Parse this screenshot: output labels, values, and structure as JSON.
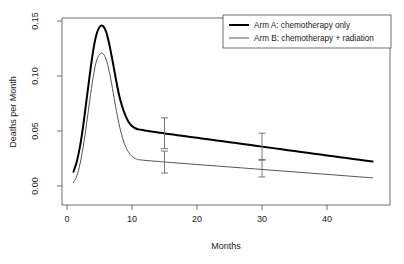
{
  "chart_data": {
    "type": "line",
    "title": "",
    "xlabel": "Months",
    "ylabel": "Deaths per Month",
    "xlim": [
      0,
      47
    ],
    "ylim": [
      0.0,
      0.155
    ],
    "grid": false,
    "legend_position": "top-right",
    "x_ticks": [
      "0",
      "10",
      "20",
      "30",
      "40"
    ],
    "x_tick_values": [
      0,
      10,
      20,
      30,
      40
    ],
    "y_ticks": [
      "0.00",
      "0.05",
      "0.10",
      "0.15"
    ],
    "y_tick_values": [
      0.0,
      0.05,
      0.1,
      0.15
    ],
    "series": [
      {
        "name": "Arm A: chemotherapy only",
        "color": "#000000",
        "line_width": 2.0,
        "x": [
          1,
          1.5,
          2,
          2.5,
          3,
          3.5,
          4,
          4.5,
          5,
          5.5,
          6,
          6.5,
          7,
          7.5,
          8,
          8.5,
          9,
          9.5,
          10,
          10.5,
          11,
          12,
          13,
          14,
          15,
          17,
          19,
          21,
          23,
          25,
          27,
          29,
          31,
          33,
          35,
          37,
          39,
          41,
          43,
          45,
          47
        ],
        "values": [
          0.013,
          0.022,
          0.036,
          0.055,
          0.078,
          0.101,
          0.122,
          0.137,
          0.1445,
          0.1455,
          0.1405,
          0.129,
          0.114,
          0.098,
          0.083,
          0.072,
          0.064,
          0.058,
          0.0545,
          0.0525,
          0.0515,
          0.0505,
          0.0495,
          0.0487,
          0.0478,
          0.0462,
          0.0446,
          0.043,
          0.0414,
          0.0398,
          0.0382,
          0.0366,
          0.035,
          0.0334,
          0.0318,
          0.0302,
          0.0286,
          0.027,
          0.0254,
          0.0238,
          0.0222
        ]
      },
      {
        "name": "Arm B: chemotherapy + radiation",
        "color": "#555555",
        "line_width": 1.0,
        "x": [
          1,
          1.5,
          2,
          2.5,
          3,
          3.5,
          4,
          4.5,
          5,
          5.5,
          6,
          6.5,
          7,
          7.5,
          8,
          8.5,
          9,
          9.5,
          10,
          10.5,
          11,
          12,
          13,
          14,
          15,
          17,
          19,
          21,
          23,
          25,
          27,
          29,
          31,
          33,
          35,
          37,
          39,
          41,
          43,
          45,
          47
        ],
        "values": [
          0.003,
          0.009,
          0.02,
          0.036,
          0.056,
          0.078,
          0.098,
          0.113,
          0.1195,
          0.1205,
          0.1155,
          0.104,
          0.0885,
          0.0715,
          0.0565,
          0.0445,
          0.036,
          0.0305,
          0.027,
          0.025,
          0.024,
          0.0233,
          0.0228,
          0.0223,
          0.0218,
          0.0209,
          0.02,
          0.0191,
          0.0182,
          0.0173,
          0.0164,
          0.0155,
          0.0146,
          0.0137,
          0.0128,
          0.0119,
          0.011,
          0.0101,
          0.0092,
          0.0083,
          0.0074
        ]
      }
    ],
    "error_bars": [
      {
        "series": "Arm A: chemotherapy only",
        "x": 15,
        "y": 0.0478,
        "low": 0.034,
        "high": 0.062
      },
      {
        "series": "Arm A: chemotherapy only",
        "x": 30,
        "y": 0.0358,
        "low": 0.0235,
        "high": 0.048
      },
      {
        "series": "Arm B: chemotherapy + radiation",
        "x": 15,
        "y": 0.0218,
        "low": 0.0118,
        "high": 0.0318
      },
      {
        "series": "Arm B: chemotherapy + radiation",
        "x": 30,
        "y": 0.016,
        "low": 0.0082,
        "high": 0.024
      }
    ]
  },
  "legend": {
    "entries": [
      {
        "label": "Arm A: chemotherapy only"
      },
      {
        "label": "Arm B: chemotherapy + radiation"
      }
    ]
  },
  "axes": {
    "x_title": "Months",
    "y_title": "Deaths per Month"
  },
  "colors": {
    "arm_a": "#000000",
    "arm_b": "#555555",
    "axis": "#000000",
    "background": "#ffffff"
  }
}
